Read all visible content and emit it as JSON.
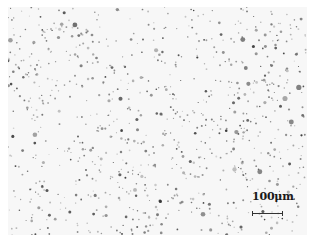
{
  "image": {
    "description": "Optical micrograph of a light specimen surface with scattered dark particles",
    "background_color": "#f7f7f7",
    "particle_color": "#3a3a3a",
    "particle_count": 900,
    "seed": 17
  },
  "scale_bar": {
    "label": "100μm",
    "length_px": 31
  }
}
